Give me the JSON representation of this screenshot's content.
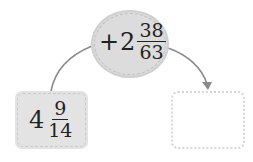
{
  "operation": {
    "sign": "+",
    "whole": "2",
    "numerator": "38",
    "denominator": "63"
  },
  "start": {
    "whole": "4",
    "numerator": "9",
    "denominator": "14"
  },
  "result": {
    "value": ""
  },
  "colors": {
    "fill": "#dcdcdc",
    "arrow": "#888888",
    "text": "#222222"
  }
}
